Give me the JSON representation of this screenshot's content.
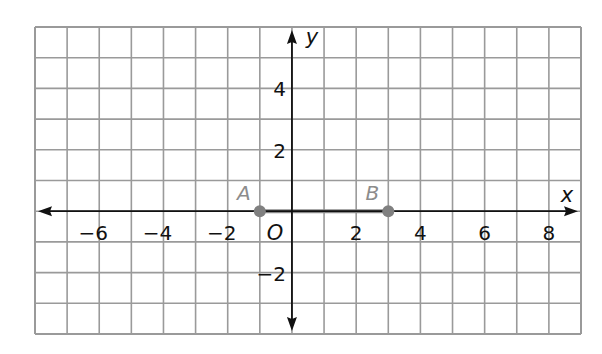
{
  "chart_data": {
    "type": "scatter",
    "title": "",
    "xlabel": "x",
    "ylabel": "y",
    "origin_label": "O",
    "xlim": [
      -8,
      9
    ],
    "ylim": [
      -4,
      6
    ],
    "grid": true,
    "x_ticks": [
      -6,
      -4,
      -2,
      2,
      4,
      6,
      8
    ],
    "y_ticks": [
      4,
      2,
      -2
    ],
    "tick_labels_x": [
      "−6",
      "−4",
      "−2",
      "2",
      "4",
      "6",
      "8"
    ],
    "tick_labels_y": [
      "4",
      "2",
      "−2"
    ],
    "points": [
      {
        "label": "A",
        "x": -1,
        "y": 0
      },
      {
        "label": "B",
        "x": 3,
        "y": 0
      }
    ],
    "segments": [
      {
        "from": "A",
        "to": "B"
      }
    ]
  },
  "colors": {
    "grid": "#9a9a9a",
    "axis": "#111111",
    "point": "#808080",
    "segment": "#8a8a8a",
    "point_label": "#8c8c8c"
  }
}
